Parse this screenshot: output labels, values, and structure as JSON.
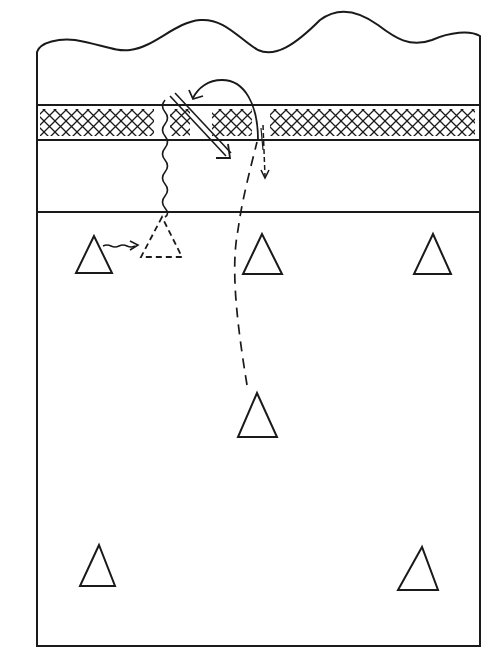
{
  "diagram": {
    "type": "volleyball-court-play-diagram",
    "colors": {
      "ink": "#1a1a1a",
      "paper": "#ffffff"
    },
    "court": {
      "left": 36,
      "right": 480,
      "bottom": 646,
      "top_edge": "wavy-tear",
      "net_band": {
        "top": 105,
        "bottom": 140,
        "fill": "crosshatch"
      },
      "attack_line_y": 212
    },
    "players": [
      {
        "id": "left-front",
        "x": 94,
        "y_top": 236,
        "y_bottom": 272,
        "style": "solid"
      },
      {
        "id": "left-front-moved",
        "x": 162,
        "y_top": 217,
        "y_bottom": 257,
        "style": "dashed"
      },
      {
        "id": "middle-front",
        "x": 262,
        "y_top": 234,
        "y_bottom": 274,
        "style": "solid"
      },
      {
        "id": "right-front",
        "x": 433,
        "y_top": 234,
        "y_bottom": 274,
        "style": "solid"
      },
      {
        "id": "middle-back",
        "x": 257,
        "y_top": 393,
        "y_bottom": 437,
        "style": "solid"
      },
      {
        "id": "left-back",
        "x": 98,
        "y_top": 545,
        "y_bottom": 587,
        "style": "solid"
      },
      {
        "id": "right-back",
        "x": 418,
        "y_top": 547,
        "y_bottom": 590,
        "style": "solid"
      }
    ],
    "paths": [
      {
        "id": "blocker-wavy-movement",
        "style": "wavy"
      },
      {
        "id": "spike-double-arrow",
        "style": "double-line-arrow"
      },
      {
        "id": "ball-arc-over-net",
        "style": "solid-curved-arrow"
      },
      {
        "id": "back-player-dashed-run",
        "style": "dashed-curve"
      },
      {
        "id": "tip-short-dashed-arrow",
        "style": "dashed-arrow"
      },
      {
        "id": "left-front-shift-arrow",
        "style": "wavy-arrow"
      }
    ]
  }
}
